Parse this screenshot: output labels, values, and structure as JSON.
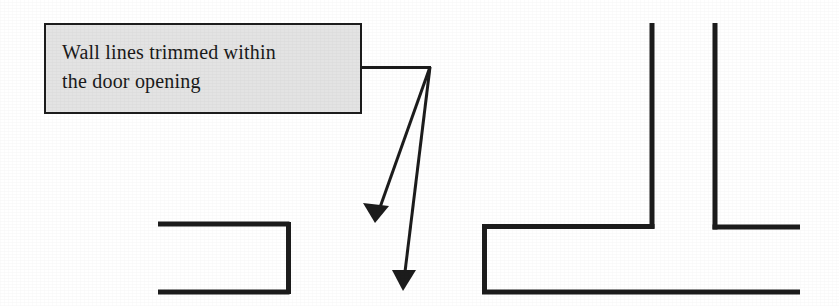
{
  "figure": {
    "width": 839,
    "height": 306,
    "background_color": "#ffffff",
    "line_color": "#1c1c1c",
    "title": "Wall lines trimmed within the door opening"
  },
  "callout": {
    "text": "Wall lines trimmed within\nthe door opening",
    "line_1": "Wall lines trimmed within",
    "line_2": "the door opening",
    "fill_color": "#e3e3e3",
    "border_color": "#1c1c1c",
    "text_color": "#1a1a1a",
    "x": 44,
    "y": 23,
    "width": 318,
    "height": 91
  },
  "leader": {
    "elbow_label": "leader-elbow",
    "start_x": 362,
    "start_y": 68,
    "corner_x": 430,
    "corner_y": 67,
    "arrow_1_tip_x": 375,
    "arrow_1_tip_y": 222,
    "arrow_2_tip_x": 403,
    "arrow_2_tip_y": 291
  },
  "walls": {
    "left_opening": {
      "label": "left-wall-door-opening",
      "top_line": {
        "x1": 158,
        "y1": 224,
        "x2": 289,
        "y2": 224
      },
      "right_line": {
        "x1": 289,
        "y1": 224,
        "x2": 289,
        "y2": 293
      },
      "bottom_line": {
        "x1": 158,
        "y1": 293,
        "x2": 289,
        "y2": 293
      }
    },
    "right_opening": {
      "label": "right-wall-tee-opening",
      "left_jamb": {
        "x1": 484,
        "y1": 226,
        "x2": 484,
        "y2": 292
      },
      "top_line_left": {
        "x1": 484,
        "y1": 226,
        "x2": 652,
        "y2": 226
      },
      "vertical_left": {
        "x1": 652,
        "y1": 23,
        "x2": 652,
        "y2": 226
      },
      "vertical_right": {
        "x1": 715,
        "y1": 23,
        "x2": 715,
        "y2": 227
      },
      "top_line_right": {
        "x1": 715,
        "y1": 227,
        "x2": 800,
        "y2": 227
      },
      "bottom_line": {
        "x1": 484,
        "y1": 292,
        "x2": 800,
        "y2": 292
      }
    }
  },
  "style": {
    "wall_stroke_width": 5,
    "leader_stroke_width": 3,
    "box_border_width": 2
  }
}
